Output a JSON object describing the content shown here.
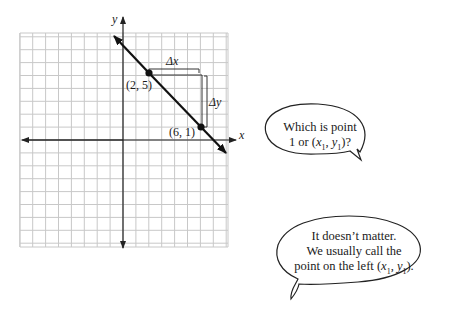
{
  "graph": {
    "axis_x_label": "x",
    "axis_y_label": "y",
    "points": [
      {
        "label": "(2, 5)",
        "x": 2,
        "y": 5
      },
      {
        "label": "(6, 1)",
        "x": 6,
        "y": 1
      }
    ],
    "delta_x_label": "Δx",
    "delta_y_label": "Δy",
    "grid": {
      "x_min": -8,
      "x_max": 8,
      "y_min": -8,
      "y_max": 8.3
    }
  },
  "bubbles": {
    "question": {
      "line1": "Which is point",
      "line2_prefix": "1 or (",
      "x1": "x",
      "sub1": "1",
      "comma": ", ",
      "y1": "y",
      "sub2": "1",
      "suffix": ")?"
    },
    "answer": {
      "line1": "It doesn’t matter.",
      "line2": "We usually call the",
      "line3_prefix": "point on the left (",
      "x1": "x",
      "sub1": "1",
      "comma": ", ",
      "y1": "y",
      "sub2": "1",
      "suffix": ")."
    }
  },
  "colors": {
    "grid": "#c8c8c8",
    "axis": "#222222",
    "line": "#111111"
  }
}
